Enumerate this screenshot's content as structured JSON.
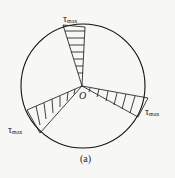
{
  "figure": {
    "caption": "(a)",
    "center_label": "O",
    "labels": {
      "top": "τ",
      "top_sub": "max",
      "right": "τ",
      "right_sub": "max",
      "left": "τ",
      "left_sub": "max"
    }
  }
}
